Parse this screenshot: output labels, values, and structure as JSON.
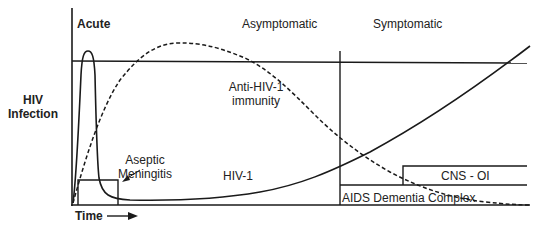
{
  "diagram": {
    "y_axis_label_line1": "HIV",
    "y_axis_label_line2": "Infection",
    "x_axis_label": "Time",
    "phases": {
      "acute": "Acute",
      "asymptomatic": "Asymptomatic",
      "symptomatic": "Symptomatic"
    },
    "curves": {
      "immunity_line1": "Anti-HIV-1",
      "immunity_line2": "immunity",
      "virus": "HIV-1"
    },
    "conditions": {
      "aseptic_line1": "Aseptic",
      "aseptic_line2": "Meningitis",
      "cns_oi": "CNS - OI",
      "adc": "AIDS Dementia Complex"
    },
    "colors": {
      "line": "#1a1a1a",
      "background": "#ffffff"
    }
  }
}
